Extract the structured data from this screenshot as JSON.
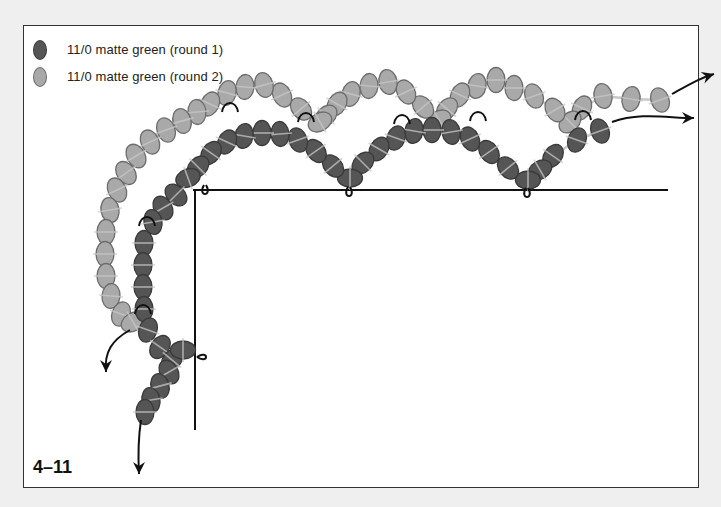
{
  "legend": {
    "items": [
      {
        "label": "11/0 matte green (round 1)",
        "color": "#555555",
        "stroke": "#3d3d3d"
      },
      {
        "label": "11/0 matte green (round 2)",
        "color": "#a9a9a9",
        "stroke": "#6f6f6f"
      }
    ]
  },
  "figure_label": "4–11",
  "colors": {
    "round1_fill": "#555555",
    "round1_stroke": "#3a3a3a",
    "round2_fill": "#a9a9a9",
    "round2_stroke": "#6c6c6c",
    "thread": "#c8c8c8",
    "line": "#111111"
  },
  "base_lines": {
    "horizontal": {
      "x1": 193,
      "y1": 190,
      "x2": 668,
      "y2": 190
    },
    "vertical": {
      "x1": 195,
      "y1": 190,
      "x2": 195,
      "y2": 430
    }
  },
  "round1_beads": [
    [
      600,
      131,
      -20
    ],
    [
      577,
      140,
      20
    ],
    [
      553,
      156,
      35
    ],
    [
      540,
      170,
      60
    ],
    [
      528,
      180,
      90
    ],
    [
      508,
      168,
      -40
    ],
    [
      489,
      152,
      -35
    ],
    [
      470,
      139,
      -25
    ],
    [
      451,
      132,
      -10
    ],
    [
      432,
      130,
      0
    ],
    [
      414,
      131,
      10
    ],
    [
      396,
      138,
      20
    ],
    [
      379,
      149,
      30
    ],
    [
      363,
      163,
      45
    ],
    [
      350,
      178,
      90
    ],
    [
      333,
      166,
      -40
    ],
    [
      316,
      151,
      -35
    ],
    [
      298,
      140,
      -20
    ],
    [
      280,
      134,
      -5
    ],
    [
      262,
      133,
      0
    ],
    [
      244,
      136,
      10
    ],
    [
      227,
      142,
      25
    ],
    [
      211,
      153,
      35
    ],
    [
      198,
      167,
      45
    ],
    [
      188,
      178,
      70
    ],
    [
      176,
      195,
      -45
    ],
    [
      163,
      208,
      -30
    ],
    [
      153,
      222,
      -10
    ],
    [
      144,
      243,
      0
    ],
    [
      143,
      265,
      0
    ],
    [
      143,
      287,
      0
    ],
    [
      144,
      309,
      0
    ],
    [
      148,
      330,
      20
    ],
    [
      160,
      347,
      35
    ],
    [
      172,
      360,
      40
    ],
    [
      183,
      350,
      90
    ],
    [
      169,
      372,
      -30
    ],
    [
      160,
      386,
      -15
    ],
    [
      151,
      400,
      -10
    ],
    [
      145,
      412,
      0
    ]
  ],
  "round2_beads": [
    [
      660,
      100,
      -20
    ],
    [
      631,
      99,
      10
    ],
    [
      603,
      96,
      -10
    ],
    [
      582,
      108,
      25
    ],
    [
      570,
      122,
      45
    ],
    [
      555,
      110,
      -30
    ],
    [
      534,
      96,
      -20
    ],
    [
      514,
      88,
      0
    ],
    [
      496,
      80,
      0
    ],
    [
      477,
      86,
      10
    ],
    [
      460,
      95,
      25
    ],
    [
      447,
      109,
      40
    ],
    [
      439,
      120,
      60
    ],
    [
      423,
      107,
      -40
    ],
    [
      406,
      92,
      -25
    ],
    [
      388,
      82,
      -10
    ],
    [
      369,
      86,
      5
    ],
    [
      351,
      94,
      15
    ],
    [
      337,
      104,
      30
    ],
    [
      326,
      116,
      45
    ],
    [
      320,
      122,
      60
    ],
    [
      301,
      109,
      -40
    ],
    [
      282,
      95,
      -25
    ],
    [
      264,
      85,
      -15
    ],
    [
      245,
      87,
      5
    ],
    [
      227,
      93,
      15
    ],
    [
      210,
      104,
      25
    ],
    [
      197,
      112,
      -5
    ],
    [
      182,
      121,
      -15
    ],
    [
      166,
      130,
      -20
    ],
    [
      150,
      142,
      -25
    ],
    [
      136,
      156,
      -30
    ],
    [
      126,
      173,
      -35
    ],
    [
      117,
      190,
      -25
    ],
    [
      110,
      210,
      -10
    ],
    [
      106,
      232,
      0
    ],
    [
      105,
      254,
      0
    ],
    [
      106,
      276,
      0
    ],
    [
      111,
      296,
      5
    ],
    [
      121,
      314,
      20
    ],
    [
      133,
      322,
      60
    ]
  ],
  "loops": [
    [
      205,
      181
    ],
    [
      349,
      183
    ],
    [
      527,
      184
    ],
    [
      205,
      357
    ],
    [
      230,
      108
    ],
    [
      306,
      118
    ],
    [
      402,
      120
    ],
    [
      478,
      117
    ],
    [
      583,
      116
    ],
    [
      147,
      222
    ],
    [
      143,
      310
    ]
  ],
  "arrows": [
    {
      "path": "M 612 122 C 640 112, 668 118, 694 118",
      "tip": [
        694,
        118
      ],
      "angle": 0
    },
    {
      "path": "M 672 94 C 690 84, 700 78, 714 74",
      "tip": [
        714,
        74
      ],
      "angle": -18
    },
    {
      "path": "M 130 330 C 112 340, 104 352, 106 372",
      "tip": [
        106,
        372
      ],
      "angle": 90
    },
    {
      "path": "M 141 420 C 138 440, 138 456, 139 474",
      "tip": [
        139,
        474
      ],
      "angle": 90
    }
  ]
}
